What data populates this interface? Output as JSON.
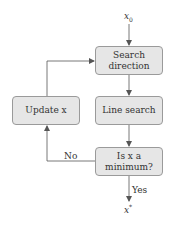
{
  "diagram": {
    "type": "flowchart",
    "title": "",
    "start": {
      "symbol": "x",
      "subscript": "0"
    },
    "end": {
      "symbol": "x",
      "superscript": "*"
    },
    "nodes": {
      "search_direction": {
        "line1": "Search",
        "line2": "direction"
      },
      "line_search": {
        "label": "Line search"
      },
      "decision": {
        "line1": "Is x a",
        "line2": "minimum?"
      },
      "update_x": {
        "label": "Update x"
      }
    },
    "edges": {
      "no_label": "No",
      "yes_label": "Yes"
    },
    "colors": {
      "box_fill": "#e6e6e6",
      "box_border": "#9a9a9a",
      "line": "#555555",
      "text": "#333333"
    }
  }
}
